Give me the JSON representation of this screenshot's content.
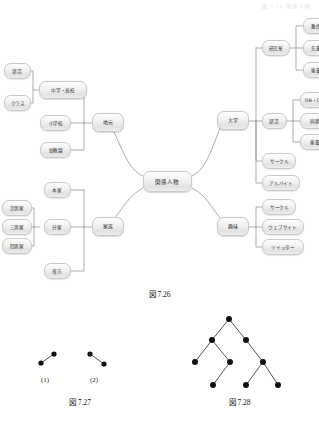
{
  "page": {
    "running_head": "図 7.26  関係人物"
  },
  "figures": [
    {
      "id": "fig-7-26",
      "caption": "図 7.26"
    },
    {
      "id": "fig-7-27",
      "caption": "図 7.27",
      "sublabels": [
        "(1)",
        "(2)"
      ]
    },
    {
      "id": "fig-7-28",
      "caption": "図 7.28"
    }
  ],
  "mindmap": {
    "center": {
      "label": "関係人物"
    },
    "branches": [
      {
        "label": "地元",
        "children": [
          {
            "label": "中学・高校",
            "children": [
              {
                "label": "部活"
              },
              {
                "label": "クラス"
              }
            ]
          },
          {
            "label": "小学校"
          },
          {
            "label": "幼稚園"
          }
        ]
      },
      {
        "label": "家族",
        "children": [
          {
            "label": "本家"
          },
          {
            "label": "分家",
            "children": [
              {
                "label": "次男家"
              },
              {
                "label": "三男家"
              },
              {
                "label": "四男家"
              }
            ]
          },
          {
            "label": "母方"
          }
        ]
      },
      {
        "label": "大学",
        "children": [
          {
            "label": "研究室",
            "children": [
              {
                "label": "教授"
              },
              {
                "label": "先輩"
              },
              {
                "label": "後輩"
              }
            ]
          },
          {
            "label": "部活",
            "children": [
              {
                "label": "OB・OG"
              },
              {
                "label": "同期"
              },
              {
                "label": "後輩"
              }
            ]
          },
          {
            "label": "サークル"
          },
          {
            "label": "アルバイト"
          }
        ]
      },
      {
        "label": "趣味",
        "children": [
          {
            "label": "サークル"
          },
          {
            "label": "ウェブサイト"
          },
          {
            "label": "ツイッター"
          }
        ]
      }
    ],
    "nodes": {
      "center": "関係人物",
      "jimoto": "地元",
      "chuko": "中学・高校",
      "bukatsu_hs": "部活",
      "class": "クラス",
      "shogakko": "小学校",
      "youchien": "幼稚園",
      "kazoku": "家族",
      "honke": "本家",
      "bunke": "分家",
      "jinanke": "次男家",
      "sannanke": "三男家",
      "yonnanke": "四男家",
      "hahakata": "母方",
      "daigaku": "大学",
      "kenkyushitsu": "研究室",
      "kyouju": "教授",
      "senpai": "先輩",
      "kouhai": "後輩",
      "bukatsu_uni": "部活",
      "ob_og": "OB・OG",
      "douki": "同期",
      "kouhai2": "後輩",
      "circle_uni": "サークル",
      "arubaito": "アルバイト",
      "shumi": "趣味",
      "circle_shumi": "サークル",
      "website": "ウェブサイト",
      "twitter": "ツイッター"
    }
  },
  "colors": {
    "node_border": "#c9c9c9",
    "node_fill_top": "#fdfdfd",
    "node_fill_bottom": "#e2e2e2",
    "connector": "#8a8a8a",
    "text": "#2a2a2a",
    "graph_vertex": "#111111",
    "graph_edge": "#555555"
  }
}
